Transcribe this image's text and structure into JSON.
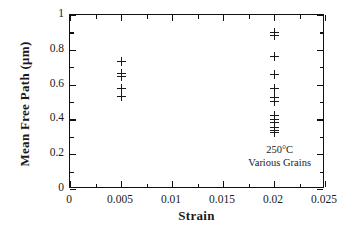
{
  "chart_data": {
    "type": "scatter",
    "title": "",
    "xlabel": "Strain",
    "ylabel": "Mean Free Path  (μm)",
    "xlim": [
      0,
      0.025
    ],
    "ylim": [
      0,
      1
    ],
    "grid": false,
    "legend": "none",
    "marker": "plus",
    "xticks": [
      0,
      0.005,
      0.01,
      0.015,
      0.02,
      0.025
    ],
    "xtick_labels": [
      "0",
      "0.005",
      "0.01",
      "0.015",
      "0.02",
      "0.025"
    ],
    "x_minor_ticks": [
      0.0025,
      0.0075,
      0.0125,
      0.0175,
      0.0225
    ],
    "yticks": [
      0,
      0.2,
      0.4,
      0.6,
      0.8,
      1
    ],
    "ytick_labels": [
      "0",
      "0.2",
      "0.4",
      "0.6",
      "0.8",
      "1"
    ],
    "y_minor_ticks": [
      0.1,
      0.3,
      0.5,
      0.7,
      0.9
    ],
    "series": [
      {
        "name": "Various Grains at 250°C",
        "x": [
          0.005,
          0.005,
          0.005,
          0.005,
          0.005,
          0.02,
          0.02,
          0.02,
          0.02,
          0.02,
          0.02,
          0.02,
          0.02,
          0.02,
          0.02,
          0.02,
          0.02,
          0.02
        ],
        "y": [
          0.735,
          0.662,
          0.648,
          0.578,
          0.532,
          0.902,
          0.884,
          0.764,
          0.659,
          0.58,
          0.527,
          0.505,
          0.425,
          0.4,
          0.385,
          0.356,
          0.336,
          0.324
        ]
      }
    ],
    "annotations": [
      {
        "text": "250°C",
        "x": 0.0205,
        "y": 0.125
      },
      {
        "text": "Various Grains",
        "x": 0.0205,
        "y": 0.055
      }
    ]
  },
  "axes": {
    "x_title": "Strain",
    "y_title": "Mean Free Path  (μm)"
  },
  "annotation": {
    "line1": "250°C",
    "line2": "Various Grains"
  },
  "colors": {
    "frame": "#111111",
    "marker": "#1a1a1a",
    "background": "#ffffff",
    "text": "#1a1a1a"
  }
}
